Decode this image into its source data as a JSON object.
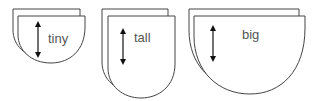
{
  "shapes": [
    {
      "label": "tiny",
      "name": "tiny"
    },
    {
      "label": "tall",
      "name": "tall"
    },
    {
      "label": "big",
      "name": "big"
    }
  ],
  "colors": {
    "stroke": "#444444",
    "fill": "#ffffff",
    "text": "#555555"
  }
}
